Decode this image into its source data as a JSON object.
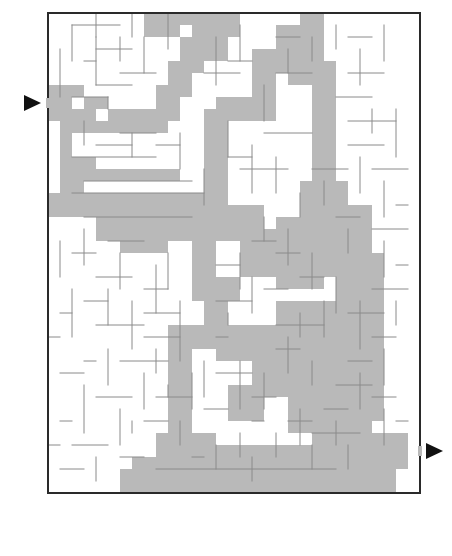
{
  "puzzle": {
    "type": "maze",
    "grid": {
      "origin_x": 48,
      "origin_y": 13,
      "cell": 12,
      "cols": 31,
      "rows": 40
    },
    "colors": {
      "frame": "#2a2a2a",
      "wall": "#8a8a8a",
      "solution": "#b9b9b9",
      "arrow": "#111111",
      "background": "#ffffff"
    },
    "entry": {
      "side": "left",
      "row": 7,
      "arrow": "right-pointing-triangle",
      "x": 24,
      "y": 103
    },
    "exit": {
      "side": "right",
      "row": 36,
      "arrow": "right-pointing-triangle",
      "x": 426,
      "y": 456
    },
    "solution_rects": [
      [
        0,
        6,
        1,
        3
      ],
      [
        1,
        6,
        2,
        1
      ],
      [
        1,
        6,
        1,
        6
      ],
      [
        2,
        8,
        2,
        2
      ],
      [
        3,
        7,
        2,
        1
      ],
      [
        3,
        9,
        6,
        1
      ],
      [
        5,
        8,
        5,
        2
      ],
      [
        9,
        6,
        2,
        3
      ],
      [
        10,
        4,
        2,
        3
      ],
      [
        11,
        2,
        2,
        3
      ],
      [
        12,
        0,
        1,
        3
      ],
      [
        8,
        0,
        4,
        1
      ],
      [
        12,
        2,
        3,
        2
      ],
      [
        13,
        0,
        3,
        2
      ],
      [
        8,
        0,
        2,
        2
      ],
      [
        9,
        1,
        2,
        1
      ],
      [
        1,
        12,
        3,
        2
      ],
      [
        1,
        13,
        10,
        1
      ],
      [
        1,
        14,
        2,
        2
      ],
      [
        0,
        15,
        14,
        2
      ],
      [
        2,
        16,
        15,
        1
      ],
      [
        4,
        17,
        12,
        2
      ],
      [
        6,
        18,
        4,
        2
      ],
      [
        13,
        8,
        2,
        9
      ],
      [
        14,
        7,
        4,
        2
      ],
      [
        17,
        3,
        2,
        6
      ],
      [
        18,
        3,
        3,
        2
      ],
      [
        19,
        1,
        4,
        3
      ],
      [
        21,
        0,
        2,
        2
      ],
      [
        20,
        1,
        3,
        5
      ],
      [
        23,
        4,
        1,
        5
      ],
      [
        22,
        6,
        2,
        10
      ],
      [
        13,
        16,
        3,
        2
      ],
      [
        15,
        16,
        3,
        3
      ],
      [
        16,
        19,
        4,
        1
      ],
      [
        12,
        17,
        2,
        7
      ],
      [
        13,
        22,
        3,
        2
      ],
      [
        13,
        23,
        2,
        5
      ],
      [
        10,
        26,
        4,
        2
      ],
      [
        10,
        27,
        2,
        11
      ],
      [
        11,
        35,
        3,
        3
      ],
      [
        12,
        37,
        7,
        1
      ],
      [
        16,
        18,
        4,
        4
      ],
      [
        19,
        17,
        4,
        6
      ],
      [
        21,
        14,
        4,
        8
      ],
      [
        23,
        16,
        4,
        6
      ],
      [
        24,
        20,
        4,
        7
      ],
      [
        25,
        22,
        3,
        12
      ],
      [
        23,
        26,
        5,
        6
      ],
      [
        19,
        24,
        6,
        6
      ],
      [
        17,
        28,
        6,
        4
      ],
      [
        17,
        26,
        3,
        3
      ],
      [
        15,
        26,
        3,
        3
      ],
      [
        14,
        27,
        2,
        2
      ],
      [
        15,
        31,
        3,
        3
      ],
      [
        20,
        32,
        7,
        3
      ],
      [
        22,
        34,
        5,
        3
      ],
      [
        24,
        36,
        6,
        2
      ],
      [
        27,
        35,
        3,
        3
      ],
      [
        6,
        38,
        23,
        2
      ],
      [
        7,
        37,
        5,
        1
      ],
      [
        14,
        36,
        7,
        2
      ],
      [
        21,
        36,
        3,
        2
      ],
      [
        9,
        35,
        3,
        3
      ]
    ],
    "walls": [
      [
        4,
        0,
        4,
        2
      ],
      [
        7,
        0,
        7,
        2
      ],
      [
        10,
        0,
        10,
        3
      ],
      [
        2,
        1,
        6,
        1
      ],
      [
        2,
        1,
        2,
        4
      ],
      [
        4,
        2,
        4,
        6
      ],
      [
        6,
        2,
        6,
        4
      ],
      [
        8,
        2,
        8,
        5
      ],
      [
        4,
        3,
        7,
        3
      ],
      [
        3,
        4,
        4,
        4
      ],
      [
        1,
        3,
        1,
        7
      ],
      [
        6,
        5,
        9,
        5
      ],
      [
        4,
        6,
        7,
        6
      ],
      [
        2,
        7,
        5,
        7
      ],
      [
        5,
        7,
        5,
        8
      ],
      [
        3,
        9,
        3,
        11
      ],
      [
        6,
        10,
        9,
        10
      ],
      [
        7,
        10,
        7,
        12
      ],
      [
        4,
        11,
        7,
        11
      ],
      [
        2,
        12,
        9,
        12
      ],
      [
        9,
        11,
        11,
        11
      ],
      [
        11,
        10,
        11,
        13
      ],
      [
        3,
        14,
        12,
        14
      ],
      [
        2,
        15,
        13,
        15
      ],
      [
        3,
        17,
        12,
        17
      ],
      [
        13,
        13,
        13,
        16
      ],
      [
        15,
        9,
        15,
        12
      ],
      [
        15,
        12,
        17,
        12
      ],
      [
        16,
        13,
        20,
        13
      ],
      [
        18,
        10,
        22,
        10
      ],
      [
        17,
        11,
        17,
        15
      ],
      [
        19,
        12,
        19,
        15
      ],
      [
        14,
        2,
        14,
        6
      ],
      [
        16,
        1,
        16,
        4
      ],
      [
        15,
        4,
        17,
        4
      ],
      [
        13,
        5,
        16,
        5
      ],
      [
        18,
        6,
        18,
        9
      ],
      [
        19,
        2,
        21,
        2
      ],
      [
        20,
        3,
        20,
        5
      ],
      [
        19,
        5,
        22,
        5
      ],
      [
        22,
        2,
        22,
        4
      ],
      [
        24,
        1,
        24,
        3
      ],
      [
        25,
        2,
        27,
        2
      ],
      [
        28,
        1,
        28,
        4
      ],
      [
        26,
        3,
        26,
        6
      ],
      [
        25,
        5,
        28,
        5
      ],
      [
        24,
        7,
        27,
        7
      ],
      [
        27,
        8,
        27,
        10
      ],
      [
        25,
        9,
        29,
        9
      ],
      [
        29,
        8,
        29,
        12
      ],
      [
        25,
        11,
        28,
        11
      ],
      [
        26,
        12,
        26,
        15
      ],
      [
        27,
        13,
        30,
        13
      ],
      [
        28,
        14,
        28,
        17
      ],
      [
        29,
        16,
        30,
        16
      ],
      [
        27,
        18,
        30,
        18
      ],
      [
        28,
        19,
        28,
        22
      ],
      [
        29,
        21,
        30,
        21
      ],
      [
        27,
        23,
        30,
        23
      ],
      [
        29,
        24,
        29,
        26
      ],
      [
        26,
        24,
        26,
        28
      ],
      [
        25,
        25,
        28,
        25
      ],
      [
        27,
        27,
        29,
        27
      ],
      [
        28,
        28,
        28,
        31
      ],
      [
        25,
        29,
        27,
        29
      ],
      [
        26,
        30,
        26,
        33
      ],
      [
        24,
        31,
        27,
        31
      ],
      [
        27,
        32,
        29,
        32
      ],
      [
        28,
        33,
        28,
        36
      ],
      [
        29,
        34,
        30,
        34
      ],
      [
        23,
        33,
        25,
        33
      ],
      [
        24,
        34,
        24,
        36
      ],
      [
        22,
        35,
        26,
        35
      ],
      [
        20,
        34,
        22,
        34
      ],
      [
        21,
        33,
        21,
        36
      ],
      [
        19,
        35,
        19,
        37
      ],
      [
        17,
        34,
        18,
        34
      ],
      [
        16,
        35,
        16,
        37
      ],
      [
        14,
        36,
        14,
        38
      ],
      [
        12,
        37,
        13,
        37
      ],
      [
        9,
        38,
        24,
        38
      ],
      [
        17,
        37,
        17,
        39
      ],
      [
        22,
        36,
        22,
        38
      ],
      [
        25,
        36,
        25,
        38
      ],
      [
        11,
        34,
        11,
        36
      ],
      [
        13,
        33,
        15,
        33
      ],
      [
        13,
        29,
        13,
        32
      ],
      [
        14,
        30,
        17,
        30
      ],
      [
        16,
        29,
        16,
        33
      ],
      [
        18,
        30,
        18,
        33
      ],
      [
        17,
        32,
        19,
        32
      ],
      [
        19,
        28,
        21,
        28
      ],
      [
        20,
        27,
        20,
        30
      ],
      [
        22,
        29,
        22,
        31
      ],
      [
        21,
        25,
        21,
        27
      ],
      [
        19,
        26,
        23,
        26
      ],
      [
        23,
        24,
        23,
        27
      ],
      [
        24,
        22,
        24,
        25
      ],
      [
        21,
        22,
        23,
        22
      ],
      [
        22,
        20,
        22,
        23
      ],
      [
        19,
        20,
        21,
        20
      ],
      [
        20,
        18,
        20,
        21
      ],
      [
        18,
        17,
        18,
        19
      ],
      [
        17,
        19,
        19,
        19
      ],
      [
        16,
        20,
        16,
        23
      ],
      [
        14,
        21,
        16,
        21
      ],
      [
        14,
        24,
        17,
        24
      ],
      [
        15,
        25,
        15,
        26
      ],
      [
        17,
        22,
        17,
        25
      ],
      [
        18,
        23,
        20,
        23
      ],
      [
        1,
        19,
        1,
        22
      ],
      [
        2,
        20,
        4,
        20
      ],
      [
        3,
        18,
        3,
        21
      ],
      [
        5,
        19,
        8,
        19
      ],
      [
        6,
        20,
        6,
        23
      ],
      [
        4,
        22,
        7,
        22
      ],
      [
        2,
        23,
        2,
        27
      ],
      [
        3,
        24,
        5,
        24
      ],
      [
        5,
        23,
        5,
        26
      ],
      [
        4,
        26,
        8,
        26
      ],
      [
        7,
        24,
        7,
        28
      ],
      [
        8,
        23,
        10,
        23
      ],
      [
        9,
        21,
        9,
        25
      ],
      [
        10,
        20,
        10,
        23
      ],
      [
        8,
        25,
        11,
        25
      ],
      [
        11,
        24,
        11,
        29
      ],
      [
        8,
        27,
        11,
        27
      ],
      [
        9,
        28,
        9,
        30
      ],
      [
        6,
        29,
        10,
        29
      ],
      [
        8,
        30,
        8,
        33
      ],
      [
        5,
        28,
        5,
        31
      ],
      [
        3,
        29,
        4,
        29
      ],
      [
        1,
        30,
        3,
        30
      ],
      [
        3,
        31,
        3,
        35
      ],
      [
        4,
        32,
        7,
        32
      ],
      [
        6,
        33,
        6,
        36
      ],
      [
        2,
        36,
        5,
        36
      ],
      [
        1,
        34,
        2,
        34
      ],
      [
        4,
        37,
        4,
        39
      ],
      [
        1,
        38,
        3,
        38
      ],
      [
        6,
        37,
        8,
        37
      ],
      [
        8,
        34,
        10,
        34
      ],
      [
        9,
        32,
        12,
        32
      ],
      [
        12,
        30,
        12,
        33
      ],
      [
        10,
        31,
        10,
        32
      ],
      [
        0,
        27,
        1,
        27
      ],
      [
        1,
        25,
        2,
        25
      ],
      [
        0,
        36,
        1,
        36
      ],
      [
        7,
        34,
        7,
        35
      ],
      [
        14,
        27,
        15,
        27
      ],
      [
        22,
        13,
        25,
        13
      ],
      [
        23,
        14,
        23,
        16
      ],
      [
        24,
        17,
        26,
        17
      ],
      [
        25,
        18,
        25,
        20
      ],
      [
        21,
        15,
        21,
        17
      ]
    ]
  }
}
